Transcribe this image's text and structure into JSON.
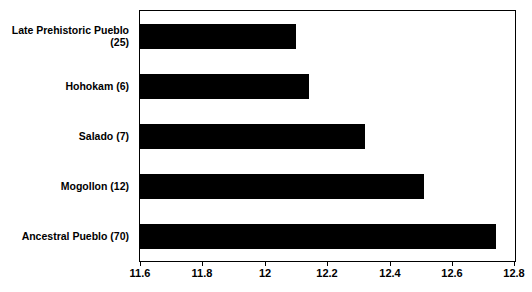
{
  "chart_data": {
    "type": "bar",
    "orientation": "horizontal",
    "title": "",
    "xlabel": "",
    "ylabel": "",
    "xlim": [
      11.6,
      12.8
    ],
    "xticks": [
      11.6,
      11.8,
      12.0,
      12.2,
      12.4,
      12.6,
      12.8
    ],
    "xtick_labels": [
      "11.6",
      "11.8",
      "12",
      "12.2",
      "12.4",
      "12.6",
      "12.8"
    ],
    "grid": false,
    "legend": false,
    "bar_color": "#000000",
    "categories": [
      "Late Prehistoric Pueblo (25)",
      "Hohokam (6)",
      "Salado (7)",
      "Mogollon (12)",
      "Ancestral Pueblo (70)"
    ],
    "category_lines": [
      [
        "Late Prehistoric Pueblo",
        "(25)"
      ],
      [
        "Hohokam (6)"
      ],
      [
        "Salado (7)"
      ],
      [
        "Mogollon (12)"
      ],
      [
        "Ancestral Pueblo (70)"
      ]
    ],
    "values": [
      12.1,
      12.14,
      12.32,
      12.51,
      12.74
    ]
  }
}
